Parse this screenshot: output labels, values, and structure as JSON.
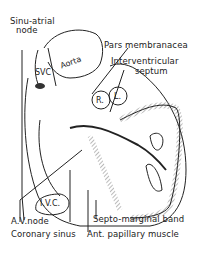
{
  "figure": {
    "labels": {
      "sinu_atrial_node_line1": "Sinu-atrial",
      "sinu_atrial_node_line2": "node",
      "pars_membranacea": "Pars membranacea",
      "interventricular_septum_line1": "Interventricular",
      "interventricular_septum_line2": "septum",
      "av_node": "A.V.node",
      "coronary_sinus": "Coronary sinus",
      "septo_marginal_band": "Septo-marginal band",
      "ant_papillary_muscle": "Ant. papillary muscle"
    },
    "inner_labels": {
      "svc": "SVC",
      "aorta": "Aorta",
      "right_cusp": "R.",
      "left_cusp": "L.",
      "ivc": "I.V.C."
    },
    "colors": {
      "ink": "#222222",
      "hatch": "#9a9a9a",
      "paper": "#ffffff"
    }
  }
}
